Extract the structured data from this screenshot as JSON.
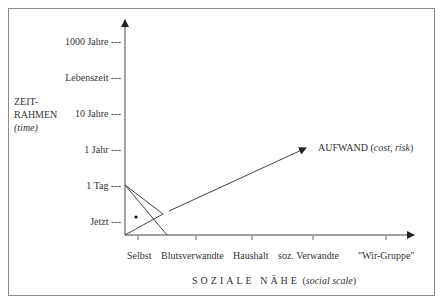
{
  "y_axis": {
    "title_line1": "ZEIT-",
    "title_line2": "RAHMEN",
    "title_line3": "(time)",
    "ticks": [
      {
        "label": "1000 Jahre ---",
        "y": 41
      },
      {
        "label": "Lebenszeit ---",
        "y": 77
      },
      {
        "label": "10 Jahre ---",
        "y": 113
      },
      {
        "label": "1 Jahr ---",
        "y": 149
      },
      {
        "label": "1 Tag ---",
        "y": 185
      },
      {
        "label": "Jetzt ---",
        "y": 221
      }
    ]
  },
  "x_axis": {
    "title_main": "SOZIALE NÄHE",
    "title_paren_open": "(",
    "title_italic": "social scale",
    "title_paren_close": ")",
    "ticks": [
      {
        "label": "Selbst",
        "x": 138
      },
      {
        "label": "Blutsverwandte",
        "x": 196
      },
      {
        "label": "Haushalt",
        "x": 252
      },
      {
        "label": "soz. Verwandte",
        "x": 313
      },
      {
        "label": "\"Wir-Gruppe\"",
        "x": 386
      }
    ]
  },
  "arrow_label": {
    "main": "AUFWAND (",
    "italic1": "cost",
    "sep": ", ",
    "italic2": "risk",
    "close": ")"
  },
  "colors": {
    "line": "#444444",
    "frame": "#8a8a8a",
    "text": "#333333"
  }
}
